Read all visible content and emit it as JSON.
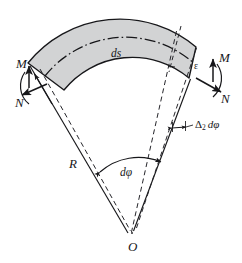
{
  "figure": {
    "name": "curved-beam-element-diagram",
    "colors": {
      "band_fill": "#d2d3d4",
      "stroke": "#17171a",
      "dash_stroke": "#35353a",
      "background": "#ffffff"
    },
    "labels": {
      "moment_left": "M",
      "normal_left": "N",
      "moment_right": "M",
      "normal_right": "N",
      "arc_length": "ds",
      "radius": "R",
      "angle_increment": "dφ",
      "rotation": "ε",
      "center": "O",
      "delta_symbol": "Δ",
      "delta_subscript": "2",
      "delta_angle": "dφ"
    }
  }
}
